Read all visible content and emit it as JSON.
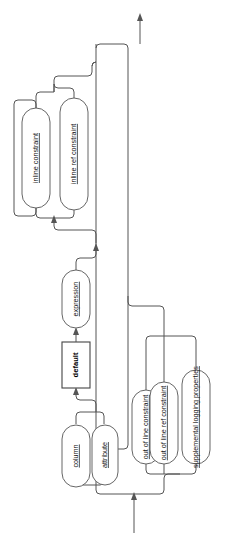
{
  "diagram": {
    "kind": "railroad-syntax-diagram",
    "orientation": "rotated-90-ccw",
    "title": "",
    "background_color": "#ffffff",
    "line_color": "#555555",
    "text_color": "#111111",
    "entry": {
      "name": "entry-arrow",
      "label": "",
      "direction": "up"
    },
    "exit": {
      "name": "exit-arrow",
      "label": "",
      "direction": "up"
    },
    "nodes": [
      {
        "id": "column",
        "label": "column",
        "shape": "oval",
        "style": "link"
      },
      {
        "id": "attribute",
        "label": "attribute",
        "shape": "oval",
        "style": "link"
      },
      {
        "id": "default",
        "label": "default",
        "shape": "rect",
        "style": "keyword"
      },
      {
        "id": "expression",
        "label": "expression",
        "shape": "oval",
        "style": "link"
      },
      {
        "id": "inline_constraint",
        "label": "inline constraint",
        "shape": "oval",
        "style": "link"
      },
      {
        "id": "inline_ref_constraint",
        "label": "inline ref constraint",
        "shape": "oval",
        "style": "link"
      },
      {
        "id": "out_of_line_constraint",
        "label": "out of line constraint",
        "shape": "oval",
        "style": "link"
      },
      {
        "id": "out_of_line_ref_constraint",
        "label": "out of line ref constraint",
        "shape": "oval",
        "style": "link"
      },
      {
        "id": "supplemental_logging_properties",
        "label": "supplemental logging properties",
        "shape": "oval",
        "style": "link"
      }
    ],
    "groups": [
      {
        "id": "column-attribute-choice",
        "label": "column / attribute alternation",
        "members": [
          "column",
          "attribute"
        ]
      },
      {
        "id": "default-expression-seq",
        "label": "default expression optional sequence",
        "members": [
          "default",
          "expression"
        ]
      },
      {
        "id": "inline-choice",
        "label": "inline constraint alternation with repeat loop",
        "members": [
          "inline_constraint",
          "inline_ref_constraint"
        ]
      },
      {
        "id": "out-of-line-choice",
        "label": "out of line alternation",
        "members": [
          "out_of_line_constraint",
          "out_of_line_ref_constraint",
          "supplemental_logging_properties"
        ]
      }
    ]
  }
}
